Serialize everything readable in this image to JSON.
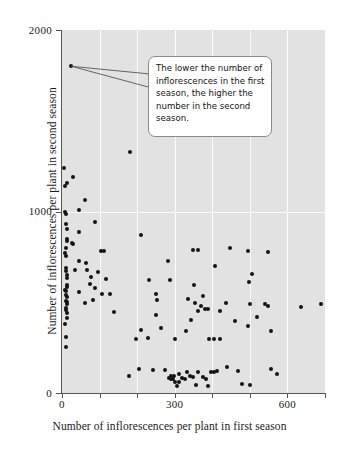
{
  "chart_data": {
    "type": "scatter",
    "title": "",
    "xlabel": "Number of inflorescences per plant in first season",
    "ylabel": "Number of inflorescences per plant in second season",
    "xlim": [
      0,
      700
    ],
    "ylim": [
      0,
      2000
    ],
    "xticks": [
      0,
      300,
      600
    ],
    "xticklabels": [
      "0",
      "300",
      "600"
    ],
    "xminorticks": [
      100,
      200,
      400,
      500,
      700
    ],
    "yticks": [
      0,
      1000,
      2000
    ],
    "yticklabels": [
      "0",
      "1000",
      "2000"
    ],
    "grid": true,
    "grid_color": "#fbfbfb",
    "panel_color": "#e2e2e2",
    "point_color": "#141414",
    "annotation": {
      "text": "The lower the number of inflorescences in the first season, the higher the number in the second season.",
      "target_x": 25,
      "target_y": 1800
    },
    "points": [
      [
        25,
        1800
      ],
      [
        182,
        1330
      ],
      [
        5,
        1240
      ],
      [
        30,
        1190
      ],
      [
        13,
        1155
      ],
      [
        8,
        1140
      ],
      [
        60,
        1065
      ],
      [
        44,
        1010
      ],
      [
        9,
        1000
      ],
      [
        10,
        985
      ],
      [
        87,
        945
      ],
      [
        11,
        930
      ],
      [
        12,
        905
      ],
      [
        45,
        890
      ],
      [
        210,
        870
      ],
      [
        13,
        850
      ],
      [
        14,
        840
      ],
      [
        26,
        825
      ],
      [
        30,
        820
      ],
      [
        10,
        800
      ],
      [
        349,
        790
      ],
      [
        362,
        790
      ],
      [
        448,
        800
      ],
      [
        494,
        785
      ],
      [
        105,
        780
      ],
      [
        112,
        780
      ],
      [
        9,
        770
      ],
      [
        548,
        775
      ],
      [
        10,
        755
      ],
      [
        44,
        725
      ],
      [
        282,
        730
      ],
      [
        63,
        715
      ],
      [
        408,
        700
      ],
      [
        10,
        690
      ],
      [
        35,
        680
      ],
      [
        66,
        680
      ],
      [
        11,
        672
      ],
      [
        97,
        665
      ],
      [
        506,
        655
      ],
      [
        12,
        648
      ],
      [
        78,
        640
      ],
      [
        13,
        635
      ],
      [
        118,
        630
      ],
      [
        232,
        625
      ],
      [
        288,
        625
      ],
      [
        498,
        610
      ],
      [
        74,
        600
      ],
      [
        13,
        595
      ],
      [
        351,
        595
      ],
      [
        14,
        585
      ],
      [
        88,
        578
      ],
      [
        9,
        570
      ],
      [
        10,
        565
      ],
      [
        44,
        556
      ],
      [
        107,
        548
      ],
      [
        128,
        545
      ],
      [
        250,
        548
      ],
      [
        11,
        540
      ],
      [
        374,
        535
      ],
      [
        12,
        530
      ],
      [
        334,
        518
      ],
      [
        82,
        512
      ],
      [
        253,
        510
      ],
      [
        11,
        505
      ],
      [
        12,
        500
      ],
      [
        60,
        495
      ],
      [
        353,
        495
      ],
      [
        437,
        495
      ],
      [
        500,
        490
      ],
      [
        13,
        488
      ],
      [
        540,
        488
      ],
      [
        548,
        482
      ],
      [
        370,
        478
      ],
      [
        10,
        470
      ],
      [
        637,
        475
      ],
      [
        688,
        490
      ],
      [
        380,
        465
      ],
      [
        389,
        462
      ],
      [
        11,
        455
      ],
      [
        362,
        452
      ],
      [
        420,
        452
      ],
      [
        137,
        448
      ],
      [
        12,
        440
      ],
      [
        249,
        432
      ],
      [
        520,
        420
      ],
      [
        13,
        412
      ],
      [
        344,
        405
      ],
      [
        460,
        395
      ],
      [
        9,
        378
      ],
      [
        496,
        372
      ],
      [
        264,
        358
      ],
      [
        211,
        345
      ],
      [
        331,
        342
      ],
      [
        556,
        340
      ],
      [
        10,
        310
      ],
      [
        196,
        300
      ],
      [
        228,
        302
      ],
      [
        300,
        300
      ],
      [
        391,
        300
      ],
      [
        404,
        298
      ],
      [
        420,
        298
      ],
      [
        11,
        255
      ],
      [
        205,
        130
      ],
      [
        179,
        92
      ],
      [
        243,
        128
      ],
      [
        273,
        125
      ],
      [
        285,
        82
      ],
      [
        291,
        78
      ],
      [
        296,
        75
      ],
      [
        300,
        60
      ],
      [
        305,
        38
      ],
      [
        312,
        105
      ],
      [
        318,
        82
      ],
      [
        327,
        78
      ],
      [
        333,
        118
      ],
      [
        340,
        95
      ],
      [
        348,
        90
      ],
      [
        356,
        42
      ],
      [
        362,
        118
      ],
      [
        374,
        88
      ],
      [
        382,
        78
      ],
      [
        389,
        40
      ],
      [
        396,
        118
      ],
      [
        404,
        118
      ],
      [
        413,
        120
      ],
      [
        438,
        142
      ],
      [
        468,
        122
      ],
      [
        478,
        52
      ],
      [
        500,
        45
      ],
      [
        556,
        135
      ],
      [
        572,
        105
      ],
      [
        289,
        95
      ],
      [
        297,
        96
      ],
      [
        311,
        62
      ]
    ]
  }
}
